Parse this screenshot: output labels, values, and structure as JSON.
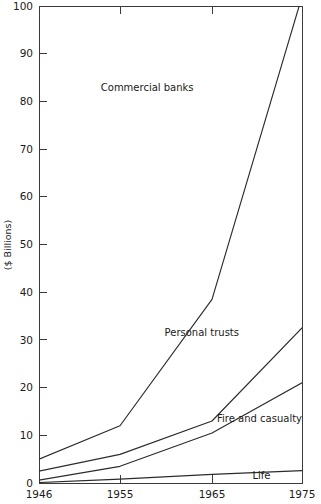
{
  "chart_data": {
    "type": "line",
    "title": "",
    "subtitle": "",
    "xlabel": "",
    "ylabel": "($ Billions)",
    "xlim": [
      1946,
      1975
    ],
    "ylim": [
      0,
      100
    ],
    "grid": false,
    "legend_position": "inline-labels",
    "x": [
      1946,
      1955,
      1965,
      1975
    ],
    "xtick_labels": [
      "1946",
      "1955",
      "1965",
      "1975"
    ],
    "ytick_labels": [
      "0",
      "10",
      "20",
      "30",
      "40",
      "50",
      "60",
      "70",
      "80",
      "90",
      "100"
    ],
    "ytick_values": [
      0,
      10,
      20,
      30,
      40,
      50,
      60,
      70,
      80,
      90,
      100
    ],
    "series": [
      {
        "name": "Commercial banks",
        "values": [
          5.0,
          12.0,
          38.5,
          102.0
        ],
        "label": "Commercial banks",
        "label_x": 1963.0,
        "label_y": 83.0,
        "label_anchor": "end",
        "clipped_at_top": true
      },
      {
        "name": "Personal trusts",
        "values": [
          2.5,
          6.0,
          13.0,
          32.5
        ],
        "label": "Personal trusts",
        "label_x": 1968.0,
        "label_y": 31.5,
        "label_anchor": "end"
      },
      {
        "name": "Fire and casualty",
        "values": [
          0.6,
          3.5,
          10.5,
          21.0
        ],
        "label": "Fire and casualty",
        "label_x": 1975.0,
        "label_y": 13.5,
        "label_anchor": "end"
      },
      {
        "name": "Life",
        "values": [
          0.1,
          0.8,
          1.8,
          2.6
        ],
        "label": "Life",
        "label_x": 1970.5,
        "label_y": 1.6,
        "label_anchor": "middle"
      }
    ],
    "colors": {
      "line": "#2b2b2b",
      "axis": "#3a3a3a",
      "text": "#1a1a1a",
      "background": "#ffffff"
    }
  }
}
